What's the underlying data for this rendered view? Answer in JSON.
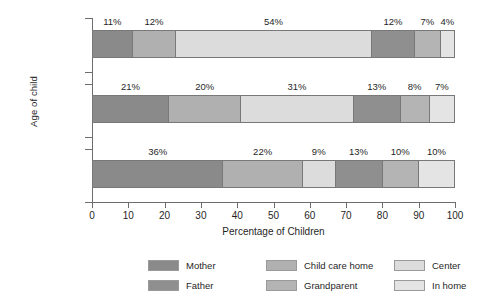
{
  "chart_data": {
    "type": "bar",
    "orientation": "horizontal",
    "stacked": true,
    "normalized_percent": true,
    "title": "",
    "xlabel": "Percentage of Children",
    "ylabel": "Age of child",
    "xlim": [
      0,
      100
    ],
    "xticks": [
      0,
      10,
      20,
      30,
      40,
      50,
      60,
      70,
      80,
      90,
      100
    ],
    "xtick_labels": [
      "0",
      "10",
      "20",
      "30",
      "40",
      "50",
      "60",
      "70",
      "80",
      "90",
      "100"
    ],
    "grid": false,
    "legend_position": "bottom",
    "categories": [
      "4½ Years",
      "3 Years",
      "6 Months"
    ],
    "series": [
      {
        "name": "Mother",
        "color": "#8a8a8a",
        "values": [
          11,
          21,
          36
        ]
      },
      {
        "name": "Father",
        "color": "#b0b0b0",
        "values": [
          12,
          20,
          22
        ]
      },
      {
        "name": "Child care home",
        "color": "#dcdcdc",
        "values": [
          54,
          31,
          9
        ]
      },
      {
        "name": "Grandparent",
        "color": "#8f8f8f",
        "values": [
          12,
          13,
          13
        ]
      },
      {
        "name": "Center",
        "color": "#b4b4b4",
        "values": [
          7,
          8,
          10
        ]
      },
      {
        "name": "In home",
        "color": "#e4e4e4",
        "values": [
          4,
          7,
          10
        ]
      }
    ],
    "bars": [
      {
        "category": "4½ Years",
        "segments": [
          {
            "series": "Mother",
            "value": 11,
            "label": "11%",
            "color": "#8a8a8a"
          },
          {
            "series": "Father",
            "value": 12,
            "label": "12%",
            "color": "#b0b0b0"
          },
          {
            "series": "Child care home",
            "value": 54,
            "label": "54%",
            "color": "#dcdcdc"
          },
          {
            "series": "Grandparent",
            "value": 12,
            "label": "12%",
            "color": "#8f8f8f"
          },
          {
            "series": "Center",
            "value": 7,
            "label": "7%",
            "color": "#b4b4b4"
          },
          {
            "series": "In home",
            "value": 4,
            "label": "4%",
            "color": "#e4e4e4"
          }
        ]
      },
      {
        "category": "3 Years",
        "segments": [
          {
            "series": "Mother",
            "value": 21,
            "label": "21%",
            "color": "#8a8a8a"
          },
          {
            "series": "Father",
            "value": 20,
            "label": "20%",
            "color": "#b0b0b0"
          },
          {
            "series": "Child care home",
            "value": 31,
            "label": "31%",
            "color": "#dcdcdc"
          },
          {
            "series": "Grandparent",
            "value": 13,
            "label": "13%",
            "color": "#8f8f8f"
          },
          {
            "series": "Center",
            "value": 8,
            "label": "8%",
            "color": "#b4b4b4"
          },
          {
            "series": "In home",
            "value": 7,
            "label": "7%",
            "color": "#e4e4e4"
          }
        ]
      },
      {
        "category": "6 Months",
        "segments": [
          {
            "series": "Mother",
            "value": 36,
            "label": "36%",
            "color": "#8a8a8a"
          },
          {
            "series": "Father",
            "value": 22,
            "label": "22%",
            "color": "#b0b0b0"
          },
          {
            "series": "Child care home",
            "value": 9,
            "label": "9%",
            "color": "#dcdcdc"
          },
          {
            "series": "Grandparent",
            "value": 13,
            "label": "13%",
            "color": "#8f8f8f"
          },
          {
            "series": "Center",
            "value": 10,
            "label": "10%",
            "color": "#b4b4b4"
          },
          {
            "series": "In home",
            "value": 10,
            "label": "10%",
            "color": "#e4e4e4"
          }
        ]
      }
    ],
    "legend_entries": [
      {
        "label": "Mother",
        "color": "#8a8a8a"
      },
      {
        "label": "Child care home",
        "color": "#b0b0b0"
      },
      {
        "label": "Center",
        "color": "#dcdcdc"
      },
      {
        "label": "Father",
        "color": "#8f8f8f"
      },
      {
        "label": "Grandparent",
        "color": "#b4b4b4"
      },
      {
        "label": "In home",
        "color": "#e4e4e4"
      }
    ]
  },
  "axes": {
    "x_title": "Percentage of Children",
    "y_title": "Age of child"
  }
}
